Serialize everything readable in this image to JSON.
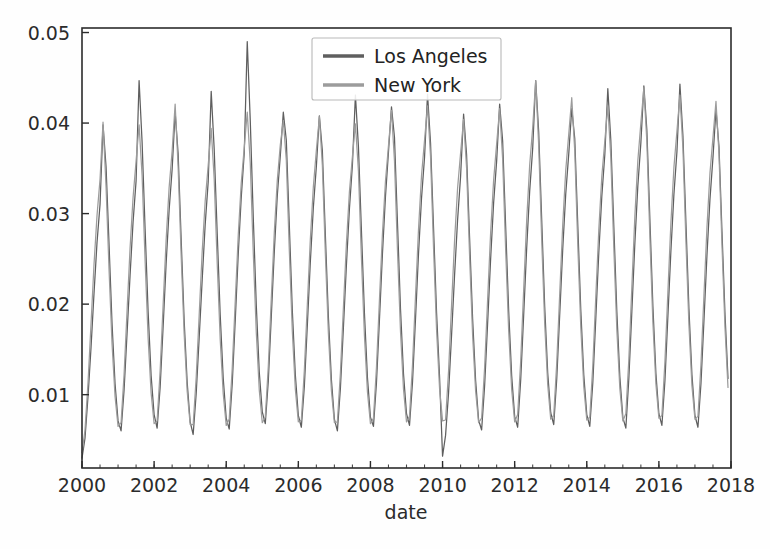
{
  "chart_data": {
    "type": "line",
    "title": "",
    "subtitle": "",
    "xlabel": "date",
    "ylabel": "",
    "grid": false,
    "legend_position": "top-center",
    "xlim": [
      2000.0,
      2018.0
    ],
    "ylim": [
      0.0019,
      0.0505
    ],
    "x_ticks": [
      2000,
      2002,
      2004,
      2006,
      2008,
      2010,
      2012,
      2014,
      2016,
      2018
    ],
    "x_tick_labels": [
      "2000",
      "2002",
      "2004",
      "2006",
      "2008",
      "2010",
      "2012",
      "2014",
      "2016",
      "2018"
    ],
    "y_ticks": [
      0.01,
      0.02,
      0.03,
      0.04,
      0.05
    ],
    "y_tick_labels": [
      "0.01",
      "0.02",
      "0.03",
      "0.04",
      "0.05"
    ],
    "x_minor_tick_interval": 0.5,
    "series": [
      {
        "name": "Los Angeles",
        "color": "#5f5f5f",
        "x_start": 2000.0,
        "x_step": 0.0833333,
        "values": [
          0.003,
          0.0052,
          0.0098,
          0.0152,
          0.0212,
          0.0268,
          0.031,
          0.0398,
          0.0352,
          0.0266,
          0.0178,
          0.0112,
          0.0071,
          0.006,
          0.0105,
          0.0168,
          0.0232,
          0.0291,
          0.0336,
          0.0447,
          0.0379,
          0.0283,
          0.0192,
          0.0121,
          0.0078,
          0.0063,
          0.0108,
          0.0175,
          0.0245,
          0.0304,
          0.0349,
          0.0412,
          0.0366,
          0.0272,
          0.0182,
          0.0114,
          0.007,
          0.0056,
          0.0101,
          0.0163,
          0.0227,
          0.0288,
          0.0335,
          0.0435,
          0.0371,
          0.0278,
          0.0188,
          0.0118,
          0.0074,
          0.0062,
          0.0112,
          0.0182,
          0.0255,
          0.0318,
          0.0367,
          0.049,
          0.0403,
          0.0296,
          0.0199,
          0.0125,
          0.0081,
          0.0068,
          0.0115,
          0.0186,
          0.0258,
          0.032,
          0.0364,
          0.0412,
          0.0381,
          0.0287,
          0.0193,
          0.0122,
          0.0077,
          0.0064,
          0.0109,
          0.0177,
          0.0247,
          0.0307,
          0.0352,
          0.0408,
          0.0369,
          0.0276,
          0.0186,
          0.0117,
          0.0073,
          0.006,
          0.0107,
          0.0174,
          0.0243,
          0.0305,
          0.0354,
          0.0431,
          0.0374,
          0.0281,
          0.019,
          0.0119,
          0.0075,
          0.0065,
          0.0113,
          0.0183,
          0.0256,
          0.0319,
          0.0368,
          0.0418,
          0.0384,
          0.0289,
          0.0195,
          0.0123,
          0.0079,
          0.0066,
          0.0114,
          0.0184,
          0.0256,
          0.0317,
          0.0362,
          0.0432,
          0.0378,
          0.0284,
          0.0191,
          0.012,
          0.0032,
          0.0055,
          0.0102,
          0.0166,
          0.0232,
          0.0293,
          0.0341,
          0.041,
          0.0365,
          0.0273,
          0.0184,
          0.0116,
          0.0072,
          0.0061,
          0.011,
          0.0179,
          0.025,
          0.0312,
          0.0358,
          0.0421,
          0.038,
          0.0286,
          0.0193,
          0.0121,
          0.0076,
          0.0064,
          0.0116,
          0.0188,
          0.0262,
          0.0325,
          0.0372,
          0.0447,
          0.039,
          0.0293,
          0.0197,
          0.0124,
          0.008,
          0.0067,
          0.0117,
          0.0189,
          0.0261,
          0.0322,
          0.0366,
          0.0416,
          0.0383,
          0.0288,
          0.0194,
          0.0122,
          0.0078,
          0.0065,
          0.0113,
          0.0184,
          0.0257,
          0.0319,
          0.0365,
          0.0438,
          0.0381,
          0.0286,
          0.0192,
          0.012,
          0.0075,
          0.0063,
          0.0118,
          0.0192,
          0.0267,
          0.0331,
          0.0378,
          0.0441,
          0.0392,
          0.0294,
          0.0198,
          0.0124,
          0.0079,
          0.0066,
          0.0115,
          0.0187,
          0.0259,
          0.0321,
          0.0368,
          0.0443,
          0.0386,
          0.029,
          0.0195,
          0.0122,
          0.0077,
          0.0064,
          0.0112,
          0.0182,
          0.0254,
          0.0316,
          0.0362,
          0.0415,
          0.0374,
          0.028,
          0.0189,
          0.0118
        ]
      },
      {
        "name": "New York",
        "color": "#9c9c9c",
        "x_start": 2000.0,
        "x_step": 0.0833333,
        "values": [
          0.0036,
          0.0061,
          0.0113,
          0.0178,
          0.0244,
          0.0298,
          0.0338,
          0.0401,
          0.033,
          0.0238,
          0.0156,
          0.0098,
          0.0065,
          0.0069,
          0.0122,
          0.0193,
          0.0262,
          0.0318,
          0.0358,
          0.0398,
          0.0342,
          0.0248,
          0.0163,
          0.0102,
          0.0068,
          0.0071,
          0.0126,
          0.0199,
          0.0271,
          0.0329,
          0.0369,
          0.0421,
          0.0351,
          0.0254,
          0.0167,
          0.0104,
          0.0067,
          0.0067,
          0.0119,
          0.0188,
          0.0258,
          0.0314,
          0.0353,
          0.0394,
          0.0338,
          0.0245,
          0.0161,
          0.0101,
          0.0066,
          0.0073,
          0.0129,
          0.0203,
          0.0276,
          0.0334,
          0.0373,
          0.0412,
          0.0356,
          0.0257,
          0.0169,
          0.0105,
          0.0069,
          0.0075,
          0.0131,
          0.0206,
          0.0279,
          0.0337,
          0.0376,
          0.0403,
          0.0359,
          0.0259,
          0.017,
          0.0106,
          0.007,
          0.0072,
          0.0127,
          0.02,
          0.0272,
          0.033,
          0.037,
          0.0407,
          0.0353,
          0.0255,
          0.0168,
          0.0105,
          0.0069,
          0.007,
          0.0124,
          0.0196,
          0.0267,
          0.0324,
          0.0363,
          0.0399,
          0.0347,
          0.0251,
          0.0165,
          0.0103,
          0.0068,
          0.0074,
          0.013,
          0.0205,
          0.0278,
          0.0336,
          0.0375,
          0.0414,
          0.0358,
          0.0259,
          0.017,
          0.0106,
          0.007,
          0.0076,
          0.0133,
          0.0209,
          0.0283,
          0.0342,
          0.0381,
          0.0419,
          0.0363,
          0.0262,
          0.0172,
          0.0107,
          0.0071,
          0.0072,
          0.0126,
          0.0199,
          0.027,
          0.0328,
          0.0367,
          0.0404,
          0.035,
          0.0253,
          0.0166,
          0.0104,
          0.0069,
          0.0074,
          0.013,
          0.0205,
          0.0279,
          0.0337,
          0.0377,
          0.0416,
          0.036,
          0.026,
          0.0171,
          0.0106,
          0.007,
          0.0078,
          0.0137,
          0.0216,
          0.0293,
          0.0354,
          0.0395,
          0.0447,
          0.0375,
          0.0271,
          0.0178,
          0.0111,
          0.0073,
          0.0077,
          0.0135,
          0.0212,
          0.0288,
          0.0348,
          0.0388,
          0.0428,
          0.0369,
          0.0266,
          0.0175,
          0.0109,
          0.0072,
          0.0075,
          0.0132,
          0.0208,
          0.0282,
          0.0341,
          0.038,
          0.0419,
          0.0362,
          0.0262,
          0.0172,
          0.0107,
          0.0071,
          0.0079,
          0.0139,
          0.0219,
          0.0297,
          0.0359,
          0.04,
          0.0439,
          0.0379,
          0.0274,
          0.018,
          0.0112,
          0.0074,
          0.0077,
          0.0136,
          0.0214,
          0.029,
          0.0351,
          0.0391,
          0.0431,
          0.0372,
          0.0269,
          0.0177,
          0.011,
          0.0073,
          0.0076,
          0.0133,
          0.021,
          0.0285,
          0.0345,
          0.0384,
          0.0424,
          0.0366,
          0.0265,
          0.0174,
          0.0108
        ]
      }
    ],
    "annotations": []
  },
  "legend": {
    "entries": [
      {
        "label": "Los Angeles",
        "color": "#5f5f5f"
      },
      {
        "label": "New York",
        "color": "#9c9c9c"
      }
    ]
  },
  "axes": {
    "xlabel": "date",
    "x_tick_labels": [
      "2000",
      "2002",
      "2004",
      "2006",
      "2008",
      "2010",
      "2012",
      "2014",
      "2016",
      "2018"
    ],
    "y_tick_labels": [
      "0.01",
      "0.02",
      "0.03",
      "0.04",
      "0.05"
    ]
  },
  "colors": {
    "series_1": "#5f5f5f",
    "series_2": "#9c9c9c",
    "axis": "#2c2c2c",
    "background": "#fefefe"
  }
}
